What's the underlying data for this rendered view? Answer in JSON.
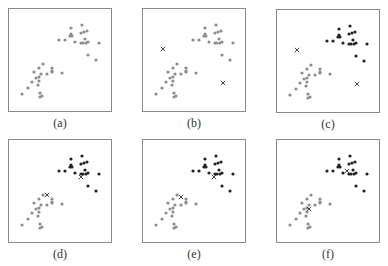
{
  "figure": {
    "points_a": [
      [
        62,
        19
      ],
      [
        73,
        16
      ],
      [
        62,
        25
      ],
      [
        63,
        27
      ],
      [
        61,
        27
      ],
      [
        72,
        24
      ],
      [
        75,
        23
      ],
      [
        78,
        22
      ],
      [
        50,
        31
      ],
      [
        56,
        31
      ],
      [
        66,
        33
      ],
      [
        76,
        30
      ],
      [
        72,
        34
      ],
      [
        74,
        34
      ],
      [
        77,
        34
      ],
      [
        79,
        33
      ],
      [
        90,
        34
      ],
      [
        79,
        46
      ],
      [
        87,
        51
      ],
      [
        34,
        55
      ],
      [
        30,
        59
      ],
      [
        43,
        59
      ],
      [
        43,
        63
      ],
      [
        25,
        63
      ],
      [
        32,
        65
      ],
      [
        38,
        65
      ],
      [
        43,
        62
      ],
      [
        53,
        64
      ],
      [
        30,
        68
      ],
      [
        27,
        69
      ],
      [
        23,
        73
      ],
      [
        30,
        72
      ],
      [
        29,
        76
      ],
      [
        19,
        79
      ],
      [
        13,
        85
      ],
      [
        31,
        84
      ],
      [
        33,
        87
      ],
      [
        31,
        88
      ]
    ],
    "upper_count": 19,
    "colors": {
      "gray": "#8c8c8c",
      "dark": "#222222",
      "border": "#8a8a8a"
    },
    "panels": [
      {
        "label": "(a)",
        "x": 8,
        "y": 8,
        "mode": "all-gray",
        "centroids": []
      },
      {
        "label": "(b)",
        "x": 142,
        "y": 8,
        "mode": "all-gray",
        "centroids": [
          [
            20,
            40
          ],
          [
            80,
            74
          ]
        ]
      },
      {
        "label": "(c)",
        "x": 276,
        "y": 9,
        "mode": "split",
        "centroids": [
          [
            20,
            40
          ],
          [
            80,
            74
          ]
        ]
      },
      {
        "label": "(d)",
        "x": 8,
        "y": 139,
        "mode": "split",
        "centroids": [
          [
            38,
            55
          ],
          [
            72,
            37
          ]
        ]
      },
      {
        "label": "(e)",
        "x": 142,
        "y": 139,
        "mode": "split",
        "centroids": [
          [
            38,
            57
          ],
          [
            71,
            37
          ]
        ]
      },
      {
        "label": "(f)",
        "x": 276,
        "y": 139,
        "mode": "split",
        "centroids": [
          [
            32,
            69
          ],
          [
            70,
            31
          ]
        ]
      }
    ]
  }
}
